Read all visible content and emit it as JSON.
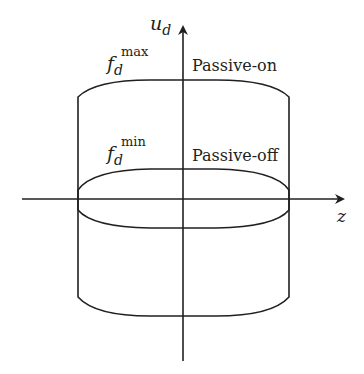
{
  "axes": {
    "vertical_label": "u",
    "vertical_sub": "d",
    "horizontal_label": "z"
  },
  "curves": {
    "outer": {
      "label_base": "f",
      "label_sub": "d",
      "label_sup": "max",
      "state": "Passive-on"
    },
    "inner": {
      "label_base": "f",
      "label_sub": "d",
      "label_sup": "min",
      "state": "Passive-off"
    }
  },
  "colors": {
    "stroke": "#231f20",
    "background": "#ffffff"
  }
}
